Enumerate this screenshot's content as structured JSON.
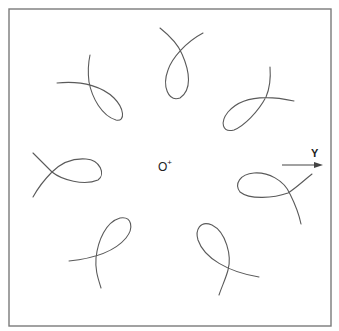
{
  "diagram": {
    "origin": {
      "label": "O",
      "marker": "+"
    },
    "axis": {
      "label": "Y",
      "direction": "right"
    },
    "colors": {
      "stroke": "#5a5a5a",
      "frame": "#7a7a7a",
      "background": "#ffffff"
    },
    "loops": [
      {
        "position": "top"
      },
      {
        "position": "upper-right"
      },
      {
        "position": "right"
      },
      {
        "position": "lower-right"
      },
      {
        "position": "bottom"
      },
      {
        "position": "left-lower"
      },
      {
        "position": "left"
      },
      {
        "position": "upper-left"
      }
    ]
  }
}
